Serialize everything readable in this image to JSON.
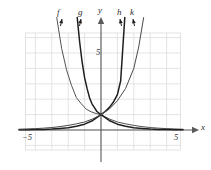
{
  "figure": {
    "title": "",
    "background_color": "#ffffff",
    "grid_color": "#d8d8d8",
    "axis_color": "#5a5a5a",
    "curve_color": "#1f1f1f",
    "curve_color_light": "#4a4a4a",
    "label_color": "#2b2b2b"
  },
  "curve_labels": [
    {
      "name": "f",
      "text": "f"
    },
    {
      "name": "g",
      "text": "g"
    },
    {
      "name": "h",
      "text": "h"
    },
    {
      "name": "k",
      "text": "k"
    }
  ],
  "axis_labels": {
    "x": "x",
    "y": "y"
  },
  "tick_labels": {
    "x_left": "−5",
    "x_right": "5",
    "y_top": "5"
  },
  "chart_data": {
    "type": "line",
    "title": "",
    "xlabel": "x",
    "ylabel": "y",
    "xlim": [
      -5.8,
      5.8
    ],
    "ylim": [
      -1.6,
      7.4
    ],
    "grid": true,
    "grid_step": 1,
    "legend": "inline-curve-labels",
    "annotations": [
      {
        "text": "f",
        "x": -2.6,
        "y": 7.9
      },
      {
        "text": "g",
        "x": -1.25,
        "y": 7.9
      },
      {
        "text": "y",
        "x": 0.0,
        "y": 8.25
      },
      {
        "text": "h",
        "x": 1.35,
        "y": 7.9
      },
      {
        "text": "k",
        "x": 2.15,
        "y": 7.9
      },
      {
        "text": "5",
        "x": -0.45,
        "y": 5.0
      },
      {
        "text": "−5",
        "x": -4.7,
        "y": -0.75
      },
      {
        "text": "5",
        "x": 5.05,
        "y": -0.75
      },
      {
        "text": "x",
        "x": 6.4,
        "y": 0.35
      }
    ],
    "series": [
      {
        "name": "f",
        "label": "f",
        "description": "decaying exponential, steepest decay; f(x) = a^x with 0 < a < 1 (smallest base)",
        "base": 0.28,
        "x": [
          -2.7,
          -2.4,
          -2.1,
          -1.8,
          -1.5,
          -1.2,
          -0.9,
          -0.6,
          -0.3,
          0,
          0.5,
          1,
          1.5,
          2,
          2.5,
          3,
          3.5,
          4,
          4.5,
          5
        ],
        "y": [
          7.3,
          5.3,
          3.9,
          2.9,
          2.1,
          1.7,
          1.35,
          1.18,
          1.07,
          1,
          0.72,
          0.52,
          0.4,
          0.3,
          0.22,
          0.16,
          0.12,
          0.09,
          0.07,
          0.05
        ]
      },
      {
        "name": "g",
        "label": "g",
        "description": "decaying exponential, less steep; g(x) = b^x with 0 < b < 1 (larger base than f)",
        "base": 0.14,
        "x": [
          -1.45,
          -1.3,
          -1.15,
          -1.0,
          -0.85,
          -0.7,
          -0.55,
          -0.4,
          -0.25,
          0,
          0.5,
          1,
          1.5,
          2,
          2.5,
          3,
          3.5,
          4,
          4.5,
          5
        ],
        "y": [
          7.3,
          5.7,
          4.4,
          3.4,
          2.7,
          2.1,
          1.7,
          1.45,
          1.2,
          1,
          0.62,
          0.38,
          0.24,
          0.15,
          0.1,
          0.06,
          0.04,
          0.03,
          0.02,
          0.01
        ]
      },
      {
        "name": "h",
        "label": "h",
        "description": "growing exponential, steepest growth; h(x) = c^x with c > 1 (largest base)",
        "base": 7.2,
        "x": [
          -5,
          -4.5,
          -4,
          -3.5,
          -3,
          -2.5,
          -2,
          -1.5,
          -1,
          -0.5,
          0,
          0.25,
          0.5,
          0.75,
          1,
          1.2,
          1.45
        ],
        "y": [
          0.01,
          0.02,
          0.03,
          0.04,
          0.06,
          0.1,
          0.15,
          0.24,
          0.38,
          0.62,
          1,
          1.2,
          1.45,
          1.8,
          2.3,
          3.2,
          7.3
        ]
      },
      {
        "name": "k",
        "label": "k",
        "description": "growing exponential, less steep; k(x) = d^x with d > 1 (smaller base than h)",
        "base": 3.6,
        "x": [
          -5,
          -4.5,
          -4,
          -3.5,
          -3,
          -2.5,
          -2,
          -1.5,
          -1,
          -0.5,
          0,
          0.5,
          1,
          1.5,
          2,
          2.3,
          2.6
        ],
        "y": [
          0.05,
          0.07,
          0.09,
          0.12,
          0.16,
          0.22,
          0.3,
          0.4,
          0.52,
          0.72,
          1,
          1.35,
          1.9,
          2.7,
          4.0,
          5.4,
          7.3
        ]
      }
    ]
  }
}
